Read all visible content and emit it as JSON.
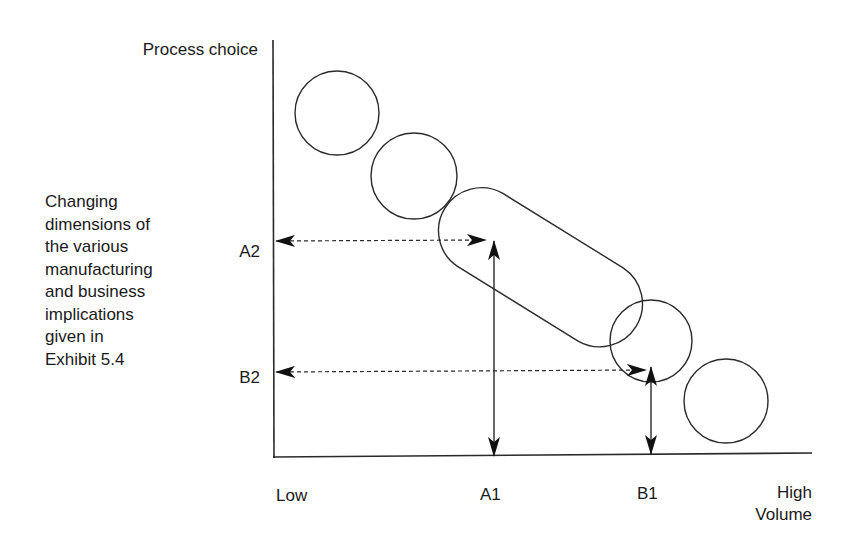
{
  "diagram": {
    "y_axis_title": "Process choice",
    "description_lines": [
      "Changing",
      "dimensions of",
      "the various",
      "manufacturing",
      "and business",
      "implications",
      "given in",
      "Exhibit 5.4"
    ],
    "y_ticks": {
      "a2": "A2",
      "b2": "B2"
    },
    "x_ticks": {
      "low": "Low",
      "a1": "A1",
      "b1": "B1",
      "high": "High"
    },
    "x_axis_title": "Volume",
    "shapes": [
      {
        "type": "circle",
        "cx": 337,
        "cy": 113,
        "r": 42
      },
      {
        "type": "circle",
        "cx": 414,
        "cy": 176,
        "r": 43
      },
      {
        "type": "stadium",
        "x1": 500,
        "y1": 236,
        "x2": 573,
        "y2": 290,
        "r": 43
      },
      {
        "type": "circle",
        "cx": 651,
        "cy": 341,
        "r": 41
      },
      {
        "type": "circle",
        "cx": 726,
        "cy": 401,
        "r": 42
      }
    ],
    "colors": {
      "line": "#2a2a2a",
      "arrow": "#111111"
    }
  }
}
